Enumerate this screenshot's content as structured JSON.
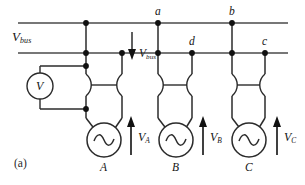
{
  "figure": {
    "caption": "(a)",
    "bus_label": {
      "base": "V",
      "sub": "bus"
    },
    "bus_arrow_label": {
      "base": "V",
      "sub": "bus"
    },
    "voltmeter_label": "V",
    "nodes": [
      {
        "id": "node-a",
        "label": "a",
        "x": 158,
        "y": 23
      },
      {
        "id": "node-b",
        "label": "b",
        "x": 232,
        "y": 23
      },
      {
        "id": "node-c",
        "label": "c",
        "x": 265,
        "y": 53
      },
      {
        "id": "node-d",
        "label": "d",
        "x": 192,
        "y": 53
      }
    ],
    "generators": [
      {
        "id": "generator-a",
        "label": "A",
        "voltage": {
          "base": "V",
          "sub": "A"
        }
      },
      {
        "id": "generator-b",
        "label": "B",
        "voltage": {
          "base": "V",
          "sub": "B"
        }
      },
      {
        "id": "generator-c",
        "label": "C",
        "voltage": {
          "base": "V",
          "sub": "C"
        }
      }
    ],
    "colors": {
      "line": "#2b2b2b",
      "bus": "#4a4a4a",
      "node": "#111111",
      "text": "#141414",
      "background": "#ffffff"
    }
  }
}
